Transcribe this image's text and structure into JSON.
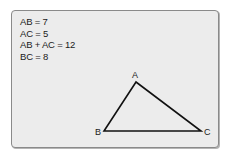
{
  "equations": [
    "AB = 7",
    "AC = 5",
    "AB + AC = 12",
    "BC = 8"
  ],
  "triangle": {
    "vertices": [
      {
        "label": "A",
        "x": 136,
        "y": 82,
        "lx": 132,
        "ly": 78
      },
      {
        "label": "B",
        "x": 104,
        "y": 131,
        "lx": 95,
        "ly": 135
      },
      {
        "label": "C",
        "x": 201,
        "y": 131,
        "lx": 204,
        "ly": 135
      }
    ],
    "stroke": "#111111"
  },
  "colors": {
    "panel_bg": "#ececec",
    "panel_border": "#8a8a8a",
    "text": "#1a1a1a"
  }
}
